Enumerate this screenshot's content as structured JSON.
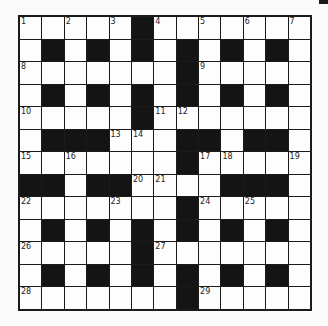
{
  "puzzle": {
    "type": "crossword",
    "rows": 13,
    "cols": 13,
    "grid": [
      "#####.#######",
      "#.#.#.#.#.#.#",
      "#######.#####",
      "#.#.#.#.#.#.#",
      "#####.#######",
      "#...###..#..#",
      "#######.#####",
      "..#..####...#",
      "#######.#####",
      "#.#.#.#.#.#.#",
      "#####.#######",
      "#.#.#.#.#.#.#",
      "#######.#####"
    ],
    "grid_legend": {
      "#": "white",
      ".": "black"
    },
    "numbers": [
      {
        "n": "1",
        "r": 0,
        "c": 0
      },
      {
        "n": "2",
        "r": 0,
        "c": 2
      },
      {
        "n": "3",
        "r": 0,
        "c": 4
      },
      {
        "n": "4",
        "r": 0,
        "c": 6
      },
      {
        "n": "5",
        "r": 0,
        "c": 8
      },
      {
        "n": "6",
        "r": 0,
        "c": 10
      },
      {
        "n": "7",
        "r": 0,
        "c": 12
      },
      {
        "n": "8",
        "r": 2,
        "c": 0
      },
      {
        "n": "9",
        "r": 2,
        "c": 8
      },
      {
        "n": "10",
        "r": 4,
        "c": 0
      },
      {
        "n": "11",
        "r": 4,
        "c": 6
      },
      {
        "n": "12",
        "r": 4,
        "c": 7
      },
      {
        "n": "13",
        "r": 5,
        "c": 4
      },
      {
        "n": "14",
        "r": 5,
        "c": 5
      },
      {
        "n": "15",
        "r": 6,
        "c": 0
      },
      {
        "n": "16",
        "r": 6,
        "c": 2
      },
      {
        "n": "17",
        "r": 6,
        "c": 8
      },
      {
        "n": "18",
        "r": 6,
        "c": 9
      },
      {
        "n": "19",
        "r": 6,
        "c": 12
      },
      {
        "n": "20",
        "r": 7,
        "c": 5
      },
      {
        "n": "21",
        "r": 7,
        "c": 6
      },
      {
        "n": "22",
        "r": 8,
        "c": 0
      },
      {
        "n": "23",
        "r": 8,
        "c": 4
      },
      {
        "n": "24",
        "r": 8,
        "c": 8
      },
      {
        "n": "25",
        "r": 8,
        "c": 10
      },
      {
        "n": "26",
        "r": 10,
        "c": 0
      },
      {
        "n": "27",
        "r": 10,
        "c": 6
      },
      {
        "n": "28",
        "r": 12,
        "c": 0
      },
      {
        "n": "29",
        "r": 12,
        "c": 8
      }
    ],
    "colors": {
      "black_square": "#141414",
      "white_square": "#fdfdfd",
      "grid_line": "#1a1a1a",
      "background": "#fbfbfb"
    }
  }
}
